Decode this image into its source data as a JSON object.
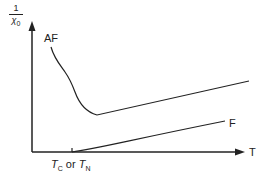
{
  "diagram": {
    "y_axis_label": {
      "numerator": "1",
      "denominator_symbol": "χ",
      "denominator_subscript": "0"
    },
    "x_axis_label": "T",
    "x_tick_label": {
      "t1": "T",
      "t1_sub": "C",
      "connector": " or ",
      "t2": "T",
      "t2_sub": "N"
    },
    "curves": [
      {
        "name": "AF",
        "label": "AF",
        "description": "antiferromagnet: decreasing to minimum at T_N, then linear rise"
      },
      {
        "name": "F",
        "label": "F",
        "description": "ferromagnet: zero below T_C, linear rise above"
      }
    ],
    "line_color": "#222222"
  }
}
